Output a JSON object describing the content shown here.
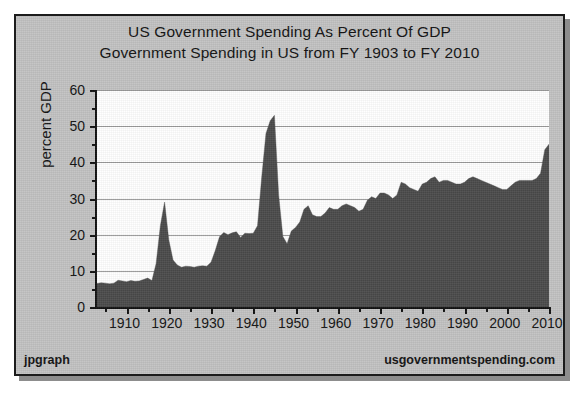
{
  "figure": {
    "title": "US Government Spending As Percent Of GDP",
    "subtitle": "Government Spending in US from FY 1903 to FY 2010",
    "ylabel": "percent GDP",
    "credit_left": "jpgraph",
    "credit_right": "usgovernmentspending.com",
    "colors": {
      "background": "#c2c2c2",
      "plot_background": "#ffffff",
      "series_fill": "#4a4a4a",
      "gridline": "#9a9a9a",
      "axis": "#101010",
      "text": "#111111"
    }
  },
  "chart_data": {
    "type": "area",
    "title": "US Government Spending As Percent Of GDP",
    "subtitle": "Government Spending in US from FY 1903 to FY 2010",
    "xlabel": "",
    "ylabel": "percent GDP",
    "xlim": [
      1903,
      2010
    ],
    "ylim": [
      0,
      60
    ],
    "grid": true,
    "legend": false,
    "y_major_ticks": [
      0,
      10,
      20,
      30,
      40,
      50,
      60
    ],
    "y_minor_ticks": [
      5,
      15,
      25,
      35,
      45,
      55
    ],
    "x_major_ticks": [
      1910,
      1920,
      1930,
      1940,
      1950,
      1960,
      1970,
      1980,
      1990,
      2000,
      2010
    ],
    "x_minor_ticks": [
      1905,
      1915,
      1925,
      1935,
      1945,
      1955,
      1965,
      1975,
      1985,
      1995,
      2005
    ],
    "series": [
      {
        "name": "Total government spending as percent of GDP",
        "x": [
          1903,
          1904,
          1905,
          1906,
          1907,
          1908,
          1909,
          1910,
          1911,
          1912,
          1913,
          1914,
          1915,
          1916,
          1917,
          1918,
          1919,
          1920,
          1921,
          1922,
          1923,
          1924,
          1925,
          1926,
          1927,
          1928,
          1929,
          1930,
          1931,
          1932,
          1933,
          1934,
          1935,
          1936,
          1937,
          1938,
          1939,
          1940,
          1941,
          1942,
          1943,
          1944,
          1945,
          1946,
          1947,
          1948,
          1949,
          1950,
          1951,
          1952,
          1953,
          1954,
          1955,
          1956,
          1957,
          1958,
          1959,
          1960,
          1961,
          1962,
          1963,
          1964,
          1965,
          1966,
          1967,
          1968,
          1969,
          1970,
          1971,
          1972,
          1973,
          1974,
          1975,
          1976,
          1977,
          1978,
          1979,
          1980,
          1981,
          1982,
          1983,
          1984,
          1985,
          1986,
          1987,
          1988,
          1989,
          1990,
          1991,
          1992,
          1993,
          1994,
          1995,
          1996,
          1997,
          1998,
          1999,
          2000,
          2001,
          2002,
          2003,
          2004,
          2005,
          2006,
          2007,
          2008,
          2009,
          2010
        ],
        "values": [
          6.5,
          6.7,
          6.6,
          6.4,
          6.6,
          7.4,
          7.2,
          7.0,
          7.3,
          7.1,
          7.2,
          7.6,
          8.0,
          7.3,
          12.0,
          22.5,
          29.0,
          18.5,
          13.0,
          11.6,
          11.0,
          11.3,
          11.2,
          11.0,
          11.3,
          11.4,
          11.3,
          12.4,
          15.6,
          19.4,
          20.6,
          20.0,
          20.5,
          20.8,
          19.2,
          20.4,
          20.3,
          20.4,
          22.5,
          36.0,
          48.0,
          51.5,
          53.0,
          31.0,
          19.5,
          17.5,
          21.0,
          22.0,
          23.5,
          27.0,
          28.0,
          25.5,
          25.0,
          25.0,
          26.0,
          27.5,
          27.0,
          27.0,
          28.0,
          28.5,
          28.0,
          27.5,
          26.5,
          27.0,
          29.5,
          30.5,
          30.0,
          31.5,
          31.5,
          31.0,
          30.0,
          31.0,
          34.5,
          34.0,
          33.0,
          32.5,
          32.0,
          34.0,
          34.5,
          35.5,
          36.0,
          34.5,
          35.0,
          35.0,
          34.5,
          34.0,
          34.0,
          34.5,
          35.5,
          36.0,
          35.5,
          35.0,
          34.5,
          34.0,
          33.5,
          33.0,
          32.5,
          32.5,
          33.5,
          34.5,
          35.0,
          35.0,
          35.0,
          35.0,
          35.5,
          37.0,
          43.5,
          45.0
        ]
      }
    ],
    "annotations": [
      {
        "label": "World War I peak",
        "x": 1919,
        "y": 29.0
      },
      {
        "label": "World War II peak",
        "x": 1945,
        "y": 53.0
      },
      {
        "label": "Recession peak",
        "x": 2010,
        "y": 45.0
      }
    ]
  }
}
